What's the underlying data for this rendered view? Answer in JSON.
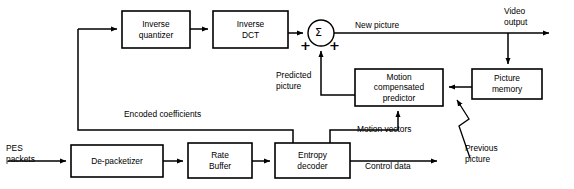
{
  "diagram": {
    "line_color": "#000000",
    "box_fill": "#ffffff",
    "boxes": [
      {
        "id": "inverse-quantizer",
        "label": "Inverse\nquantizer",
        "x": 122,
        "y": 11,
        "w": 68,
        "h": 37
      },
      {
        "id": "inverse-dct",
        "label": "Inverse\nDCT",
        "x": 213,
        "y": 11,
        "w": 75,
        "h": 37
      },
      {
        "id": "picture-memory",
        "label": "Picture\nmemory",
        "x": 472,
        "y": 69,
        "w": 70,
        "h": 30
      },
      {
        "id": "motion-compensated-predictor",
        "label": "Motion\ncompensated\npredictor",
        "x": 355,
        "y": 69,
        "w": 88,
        "h": 37
      },
      {
        "id": "de-packetizer",
        "label": "De-packetizer",
        "x": 71,
        "y": 145,
        "w": 92,
        "h": 32
      },
      {
        "id": "rate-buffer",
        "label": "Rate\nBuffer",
        "x": 188,
        "y": 143,
        "w": 64,
        "h": 35
      },
      {
        "id": "entropy-decoder",
        "label": "Entropy\ndecoder",
        "x": 275,
        "y": 143,
        "w": 75,
        "h": 35
      }
    ],
    "summing_node": {
      "id": "summing-junction",
      "symbol": "Σ",
      "cx": 321,
      "cy": 33,
      "r": 13,
      "signs": [
        "+",
        "+"
      ]
    },
    "edge_labels": [
      {
        "id": "new-picture",
        "text": "New picture",
        "x": 355,
        "y": 20
      },
      {
        "id": "video-output",
        "text": "Video\noutput",
        "x": 504,
        "y": 6
      },
      {
        "id": "predicted-picture",
        "text": "Predicted\npicture",
        "x": 276,
        "y": 70
      },
      {
        "id": "encoded-coefficients",
        "text": "Encoded coefficients",
        "x": 124,
        "y": 109
      },
      {
        "id": "motion-vectors",
        "text": "Motion vectors",
        "x": 357,
        "y": 124
      },
      {
        "id": "control-data",
        "text": "Control data",
        "x": 365,
        "y": 161
      },
      {
        "id": "previous-picture",
        "text": "Previous\npicture",
        "x": 465,
        "y": 143
      },
      {
        "id": "pes-packets",
        "text": "PES\npackets",
        "x": 6,
        "y": 143
      }
    ]
  }
}
